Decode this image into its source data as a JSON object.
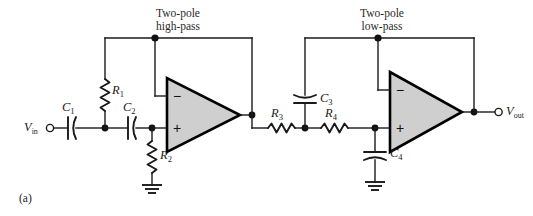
{
  "figure": {
    "panel_label": "(a)",
    "background_color": "#ffffff",
    "opamp_fill_color": "#cfcfcf",
    "wire_color": "#1a1a1a"
  },
  "stages": [
    {
      "id": "high-pass",
      "line1": "Two-pole",
      "line2": "high-pass"
    },
    {
      "id": "low-pass",
      "line1": "Two-pole",
      "line2": "low-pass"
    }
  ],
  "ports": [
    {
      "id": "input",
      "name": "V",
      "sub": "in"
    },
    {
      "id": "output",
      "name": "V",
      "sub": "out"
    }
  ],
  "components": [
    {
      "id": "C1",
      "type": "capacitor",
      "name": "C",
      "sub": "1"
    },
    {
      "id": "C2",
      "type": "capacitor",
      "name": "C",
      "sub": "2"
    },
    {
      "id": "R1",
      "type": "resistor",
      "name": "R",
      "sub": "1"
    },
    {
      "id": "R2",
      "type": "resistor",
      "name": "R",
      "sub": "2"
    },
    {
      "id": "R3",
      "type": "resistor",
      "name": "R",
      "sub": "3"
    },
    {
      "id": "R4",
      "type": "resistor",
      "name": "R",
      "sub": "4"
    },
    {
      "id": "C3",
      "type": "capacitor",
      "name": "C",
      "sub": "3"
    },
    {
      "id": "C4",
      "type": "capacitor",
      "name": "C",
      "sub": "4"
    }
  ],
  "opamps": [
    {
      "id": "opamp-1",
      "inverting": "−",
      "noninverting": "+"
    },
    {
      "id": "opamp-2",
      "inverting": "−",
      "noninverting": "+"
    }
  ]
}
